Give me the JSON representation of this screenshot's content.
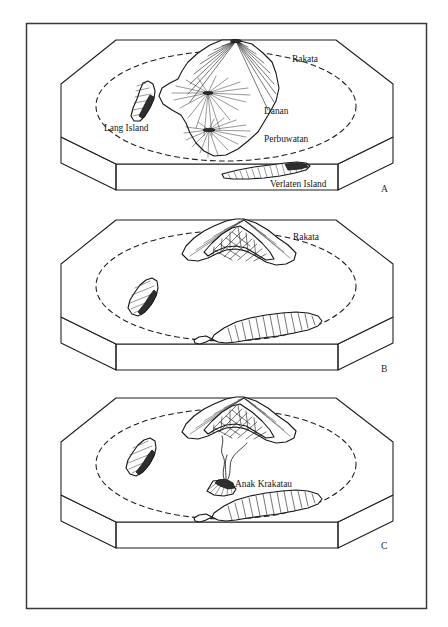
{
  "figure": {
    "panel_count": 3,
    "line_color": "#1c1c1c",
    "background_color": "#ffffff"
  },
  "panels": [
    {
      "id": "A",
      "letter": "A",
      "letter_pos": {
        "x": 381,
        "y": 192
      },
      "labels": [
        {
          "name": "rakata-label",
          "text": "Rakata",
          "x": 292,
          "y": 62,
          "anchor": "start"
        },
        {
          "name": "danan-label",
          "text": "Danan",
          "x": 264,
          "y": 114,
          "anchor": "start"
        },
        {
          "name": "perbuwatan-label",
          "text": "Perbuwatan",
          "x": 264,
          "y": 142,
          "anchor": "start"
        },
        {
          "name": "lang-island-label",
          "text": "Lang Island",
          "x": 104,
          "y": 131,
          "anchor": "start"
        },
        {
          "name": "verlaten-island-label",
          "text": "Verlaten Island",
          "x": 270,
          "y": 187,
          "anchor": "start"
        }
      ]
    },
    {
      "id": "B",
      "letter": "B",
      "letter_pos": {
        "x": 381,
        "y": 372
      },
      "labels": [
        {
          "name": "rakata-label",
          "text": "Rakata",
          "x": 293,
          "y": 240,
          "anchor": "start"
        }
      ]
    },
    {
      "id": "C",
      "letter": "C",
      "letter_pos": {
        "x": 381,
        "y": 549
      },
      "labels": [
        {
          "name": "anak-krakatau-label",
          "text": "Anak Krakatau",
          "x": 235,
          "y": 487,
          "anchor": "start"
        }
      ]
    }
  ],
  "geometry": {
    "frame": {
      "x": 26,
      "y": 23,
      "w": 400,
      "h": 585
    },
    "panel_blocks": [
      {
        "id": "A",
        "top_y": 38,
        "oct_cx": 226,
        "oct_cy": 112,
        "oct_rx": 165,
        "oct_ry": 78,
        "depth": 26,
        "front_x0": 116,
        "front_x1": 338
      },
      {
        "id": "B",
        "top_y": 218,
        "oct_cx": 226,
        "oct_cy": 292,
        "oct_rx": 165,
        "oct_ry": 78,
        "depth": 26,
        "front_x0": 116,
        "front_x1": 338
      },
      {
        "id": "C",
        "top_y": 396,
        "oct_cx": 226,
        "oct_cy": 470,
        "oct_rx": 165,
        "oct_ry": 78,
        "depth": 26,
        "front_x0": 116,
        "front_x1": 338
      }
    ],
    "caldera_rim": [
      {
        "panel": "A",
        "cx": 226,
        "cy": 112,
        "rx": 131,
        "ry": 58
      },
      {
        "panel": "B",
        "cx": 226,
        "cy": 292,
        "rx": 131,
        "ry": 58
      },
      {
        "panel": "C",
        "cx": 226,
        "cy": 470,
        "rx": 131,
        "ry": 58
      }
    ]
  },
  "features": {
    "panel_a": [
      "Rakata",
      "Danan",
      "Perbuwatan",
      "Lang Island",
      "Verlaten Island"
    ],
    "panel_b": [
      "Rakata"
    ],
    "panel_c": [
      "Anak Krakatau"
    ]
  }
}
